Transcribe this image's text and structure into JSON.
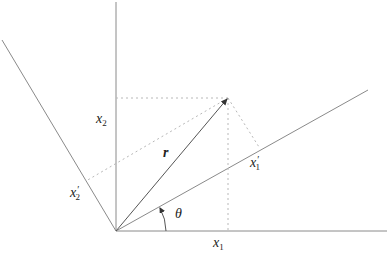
{
  "diagram": {
    "title": "",
    "type": "coordinate rotation of position vector",
    "colors": {
      "axis": "#8a8a8a",
      "vector": "#555555",
      "dotted": "#b8b8b8",
      "text": "#222222",
      "background": "#ffffff"
    },
    "labels": {
      "x1": {
        "base": "x",
        "sub": "1"
      },
      "x2": {
        "base": "x",
        "sub": "2"
      },
      "x1_prime": {
        "base": "x",
        "prime": "′",
        "sub": "1"
      },
      "x2_prime": {
        "base": "x",
        "prime": "′",
        "sub": "2"
      },
      "r": "r",
      "theta": "θ"
    },
    "geometry": {
      "origin": [
        116,
        231
      ],
      "x1_axis_end": [
        387,
        231
      ],
      "x2_axis_end": [
        116,
        2
      ],
      "x1_prime_axis_end": [
        368,
        90
      ],
      "x2_prime_axis_end": [
        2,
        40
      ],
      "vector_tip": [
        228,
        98
      ],
      "proj_x1": [
        228,
        231
      ],
      "proj_x2": [
        116,
        98
      ],
      "proj_x1_prime": [
        259,
        147
      ],
      "proj_x2_prime": [
        86,
        181
      ],
      "theta_arc_radius": 50
    }
  }
}
